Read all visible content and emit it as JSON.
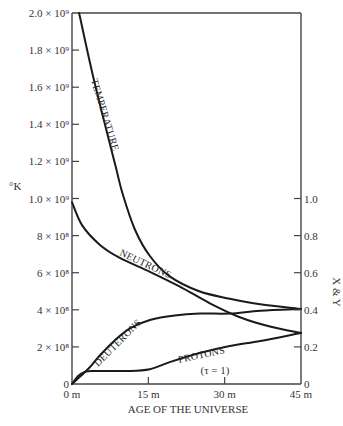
{
  "chart_data": {
    "type": "line",
    "title": "",
    "xlabel": "AGE OF THE UNIVERSE",
    "ylabel_left": "°K",
    "ylabel_right": "X & Y",
    "xlim": [
      0,
      45
    ],
    "ylim_left": [
      0,
      2000000000
    ],
    "ylim_right": [
      0,
      1.0
    ],
    "grid": false,
    "x_ticks": [
      {
        "value": 0,
        "label": "0 m"
      },
      {
        "value": 15,
        "label": "15 m"
      },
      {
        "value": 30,
        "label": "30 m"
      },
      {
        "value": 45,
        "label": "45 m"
      }
    ],
    "y_left_ticks": [
      {
        "value": 0,
        "label": "0"
      },
      {
        "value": 200000000,
        "label": "2 × 10⁸"
      },
      {
        "value": 400000000,
        "label": "4 × 10⁸"
      },
      {
        "value": 600000000,
        "label": "6 × 10⁸"
      },
      {
        "value": 800000000,
        "label": "8 × 10⁸"
      },
      {
        "value": 1000000000,
        "label": "1.0 × 10⁹"
      },
      {
        "value": 1200000000,
        "label": "1.2 × 10⁹"
      },
      {
        "value": 1400000000,
        "label": "1.4 × 10⁹"
      },
      {
        "value": 1600000000,
        "label": "1.6 × 10⁹"
      },
      {
        "value": 1800000000,
        "label": "1.8 × 10⁹"
      },
      {
        "value": 2000000000,
        "label": "2.0 × 10⁹"
      }
    ],
    "y_right_ticks": [
      {
        "value": 0,
        "label": "0"
      },
      {
        "value": 0.2,
        "label": "0.2"
      },
      {
        "value": 0.4,
        "label": "0.4"
      },
      {
        "value": 0.6,
        "label": "0.6"
      },
      {
        "value": 0.8,
        "label": "0.8"
      },
      {
        "value": 1.0,
        "label": "1.0"
      }
    ],
    "series": [
      {
        "name": "TEMPERATURE",
        "axis": "left",
        "x": [
          1.4,
          4.3,
          8.5,
          10.0,
          12.4,
          15.3,
          19.2,
          25.0,
          31.0,
          37.0,
          45.0
        ],
        "y": [
          2000000000,
          1640000000,
          1180000000,
          1020000000,
          830000000,
          690000000,
          580000000,
          500000000,
          460000000,
          430000000,
          405000000
        ]
      },
      {
        "name": "NEUTRONS",
        "axis": "right",
        "x": [
          0,
          2.0,
          5.5,
          9.4,
          15.3,
          21.2,
          27.1,
          33.0,
          38.9,
          45.0
        ],
        "y": [
          0.98,
          0.855,
          0.75,
          0.68,
          0.605,
          0.525,
          0.435,
          0.36,
          0.31,
          0.275
        ]
      },
      {
        "name": "DEUTERONS",
        "axis": "right",
        "x": [
          0,
          1.6,
          3.5,
          5.5,
          8.4,
          11.4,
          15.3,
          20.2,
          25.1,
          31.0,
          37.0,
          45.0
        ],
        "y": [
          0,
          0.04,
          0.09,
          0.155,
          0.235,
          0.3,
          0.345,
          0.37,
          0.38,
          0.38,
          0.395,
          0.405
        ]
      },
      {
        "name": "PROTONS",
        "axis": "right",
        "x": [
          0,
          1.2,
          2.5,
          4.5,
          11.4,
          15.3,
          19.2,
          25.1,
          31.0,
          37.0,
          45.0
        ],
        "y": [
          0,
          0.043,
          0.065,
          0.07,
          0.07,
          0.08,
          0.118,
          0.167,
          0.205,
          0.232,
          0.275
        ]
      }
    ],
    "annotations": [
      {
        "text": "(τ = 1)",
        "x": 30,
        "y_right": 0.06
      }
    ],
    "legend": "none (inline curve labels)"
  }
}
